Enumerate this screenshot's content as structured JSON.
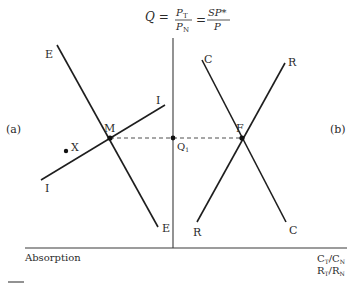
{
  "title_formula": {
    "lhs": "Q =",
    "frac1_num": "P",
    "frac1_num_sub": "T",
    "frac1_den": "P",
    "frac1_den_sub": "N",
    "eq": "=",
    "frac2_num": "SP*",
    "frac2_den": "P"
  },
  "panels": {
    "left_label": "(a)",
    "right_label": "(b)"
  },
  "axes": {
    "left_x_label": "Absorption",
    "right_x_label_line1_main": "C",
    "right_x_label_line1_sub1": "T",
    "right_x_label_line1_slash": "/C",
    "right_x_label_line1_sub2": "N",
    "right_x_label_line2_main": "R",
    "right_x_label_line2_sub1": "T",
    "right_x_label_line2_slash": "/R",
    "right_x_label_line2_sub2": "N"
  },
  "curves": {
    "E_top": "E",
    "E_bottom": "E",
    "I_top": "I",
    "I_bottom": "I",
    "C_top": "C",
    "C_bottom": "C",
    "R_top": "R",
    "R_bottom": "R"
  },
  "points": {
    "M": "M",
    "X": "X",
    "F": "F",
    "Q1_main": "Q",
    "Q1_sub": "1"
  },
  "colors": {
    "line": "#1e1e1e",
    "text": "#2a2a2a",
    "background": "#ffffff"
  }
}
